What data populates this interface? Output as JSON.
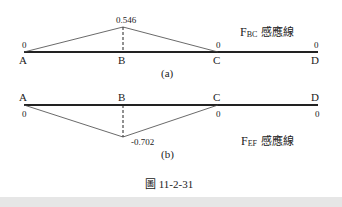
{
  "caption": "圖 11-2-31",
  "diagrams": [
    {
      "id": "a",
      "sublabel": "(a)",
      "title_main": "F",
      "title_sub": "BC",
      "title_suffix": " 感應線",
      "points": [
        {
          "name": "A",
          "value": "0"
        },
        {
          "name": "B",
          "value": "0.546"
        },
        {
          "name": "C",
          "value": "0"
        },
        {
          "name": "D",
          "value": "0"
        }
      ]
    },
    {
      "id": "b",
      "sublabel": "(b)",
      "title_main": "F",
      "title_sub": "EF",
      "title_suffix": " 感應線",
      "points": [
        {
          "name": "A",
          "value": "0"
        },
        {
          "name": "B",
          "value": "-0.702"
        },
        {
          "name": "C",
          "value": "0"
        },
        {
          "name": "D",
          "value": "0"
        }
      ]
    }
  ]
}
